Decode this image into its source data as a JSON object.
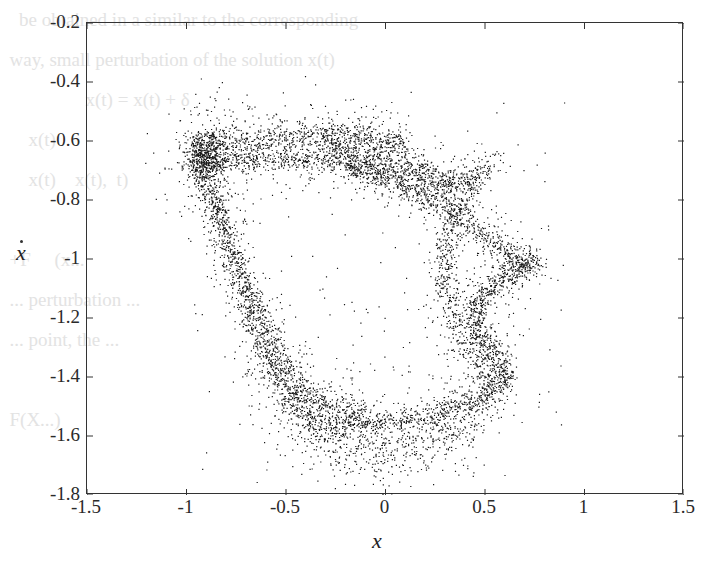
{
  "chart_data": {
    "type": "scatter",
    "title": "",
    "xlabel": "x",
    "ylabel": "ẋ",
    "xlim": [
      -1.5,
      1.5
    ],
    "ylim": [
      -1.8,
      -0.2
    ],
    "xticks": [
      "-1.5",
      "-1",
      "-0.5",
      "0",
      "0.5",
      "1",
      "1.5"
    ],
    "yticks": [
      "-0.2",
      "-0.4",
      "-0.6",
      "-0.8",
      "-1",
      "-1.2",
      "-1.4",
      "-1.6",
      "-1.8"
    ],
    "grid": false,
    "legend": null,
    "marker_color": "#1a1a1a",
    "bands": [
      {
        "points": [
          [
            -0.97,
            -0.62
          ],
          [
            -0.7,
            -0.6
          ],
          [
            -0.4,
            -0.58
          ],
          [
            -0.2,
            -0.58
          ],
          [
            0.1,
            -0.61
          ]
        ],
        "spread": 0.025,
        "n": 900
      },
      {
        "points": [
          [
            -0.98,
            -0.68
          ],
          [
            -0.7,
            -0.66
          ],
          [
            -0.3,
            -0.66
          ],
          [
            0.0,
            -0.7
          ],
          [
            0.25,
            -0.74
          ],
          [
            0.45,
            -0.76
          ]
        ],
        "spread": 0.02,
        "n": 900
      },
      {
        "points": [
          [
            -0.3,
            -0.62
          ],
          [
            0.0,
            -0.66
          ],
          [
            0.3,
            -0.72
          ],
          [
            0.45,
            -0.72
          ],
          [
            0.55,
            -0.68
          ]
        ],
        "spread": 0.022,
        "n": 500
      },
      {
        "points": [
          [
            -0.2,
            -0.68
          ],
          [
            0.05,
            -0.74
          ],
          [
            0.3,
            -0.82
          ],
          [
            0.5,
            -0.92
          ],
          [
            0.7,
            -1.02
          ],
          [
            0.75,
            -1.0
          ]
        ],
        "spread": 0.02,
        "n": 800
      },
      {
        "points": [
          [
            0.75,
            -1.0
          ],
          [
            0.55,
            -1.08
          ],
          [
            0.45,
            -1.15
          ],
          [
            0.45,
            -1.25
          ],
          [
            0.55,
            -1.32
          ],
          [
            0.62,
            -1.4
          ]
        ],
        "spread": 0.022,
        "n": 800
      },
      {
        "points": [
          [
            0.62,
            -1.4
          ],
          [
            0.45,
            -1.48
          ],
          [
            0.2,
            -1.53
          ],
          [
            -0.1,
            -1.56
          ],
          [
            -0.35,
            -1.55
          ]
        ],
        "spread": 0.02,
        "n": 700
      },
      {
        "points": [
          [
            -0.35,
            -1.55
          ],
          [
            -0.5,
            -1.45
          ],
          [
            -0.65,
            -1.25
          ],
          [
            -0.78,
            -1.0
          ],
          [
            -0.88,
            -0.8
          ],
          [
            -0.95,
            -0.68
          ]
        ],
        "spread": 0.025,
        "n": 900
      },
      {
        "points": [
          [
            -0.9,
            -0.7
          ],
          [
            -0.8,
            -0.9
          ],
          [
            -0.68,
            -1.1
          ],
          [
            -0.55,
            -1.3
          ],
          [
            -0.45,
            -1.42
          ],
          [
            -0.3,
            -1.5
          ],
          [
            -0.1,
            -1.52
          ]
        ],
        "spread": 0.02,
        "n": 700
      },
      {
        "points": [
          [
            0.4,
            -0.8
          ],
          [
            0.3,
            -0.95
          ],
          [
            0.3,
            -1.1
          ],
          [
            0.35,
            -1.25
          ],
          [
            0.5,
            -1.38
          ],
          [
            0.55,
            -1.45
          ]
        ],
        "spread": 0.03,
        "n": 600
      },
      {
        "points": [
          [
            -0.6,
            -1.35
          ],
          [
            -0.3,
            -1.6
          ],
          [
            0.0,
            -1.66
          ],
          [
            0.3,
            -1.58
          ],
          [
            0.5,
            -1.5
          ]
        ],
        "spread": 0.06,
        "n": 900
      },
      {
        "points": [
          [
            -0.95,
            -0.66
          ],
          [
            -0.85,
            -0.65
          ]
        ],
        "spread": 0.04,
        "n": 500
      }
    ],
    "scatter_noise": {
      "xrange": [
        -1.0,
        0.9
      ],
      "yrange": [
        -1.75,
        -0.45
      ],
      "n": 150
    }
  },
  "background_text": "    be obtained in a similar to the corresponding\n  way, small perturbation of the solution x(t)\n                  x(t) = x(t) + δ\n      x(t)\n      x(t)    x(t),  t)\n\n  +F     (x...\n  ... perturbation ...\n  ... point, the ...\n\n  F(X...)"
}
